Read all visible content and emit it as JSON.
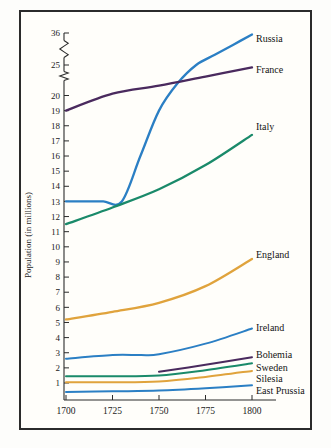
{
  "chart_data": {
    "type": "line",
    "title": "",
    "subtitle": "",
    "xlabel": "",
    "ylabel": "Population (in millions)",
    "xlim": [
      1700,
      1800
    ],
    "ylim": [
      0,
      36
    ],
    "grid": false,
    "legend_position": "right-inline-labels",
    "x_ticks": [
      "1700",
      "1725",
      "1750",
      "1775",
      "1800"
    ],
    "y_ticks": [
      "1",
      "2",
      "3",
      "4",
      "5",
      "6",
      "7",
      "8",
      "9",
      "10",
      "11",
      "12",
      "13",
      "14",
      "15",
      "16",
      "17",
      "18",
      "19",
      "20",
      "25",
      "36"
    ],
    "y_axis_breaks": [
      "between 20 and 25",
      "between 25 and 36"
    ],
    "series": [
      {
        "name": "Russia",
        "color": "#2b7fc4",
        "x": [
          1700,
          1710,
          1720,
          1730,
          1740,
          1750,
          1760,
          1770,
          1780,
          1790,
          1800
        ],
        "values": [
          13.0,
          13.0,
          13.0,
          13.0,
          16.0,
          19.0,
          22.0,
          25.0,
          28.5,
          32.0,
          35.5
        ]
      },
      {
        "name": "France",
        "color": "#4a2a5e",
        "x": [
          1700,
          1725,
          1750,
          1775,
          1800
        ],
        "values": [
          19.0,
          20.3,
          21.6,
          23.1,
          24.6
        ]
      },
      {
        "name": "Italy",
        "color": "#1a8a6a",
        "x": [
          1700,
          1725,
          1750,
          1775,
          1800
        ],
        "values": [
          11.5,
          12.6,
          13.8,
          15.4,
          17.4
        ]
      },
      {
        "name": "England",
        "color": "#e0a33c",
        "x": [
          1700,
          1725,
          1750,
          1775,
          1800
        ],
        "values": [
          5.2,
          5.7,
          6.3,
          7.4,
          9.2
        ]
      },
      {
        "name": "Ireland",
        "color": "#2b7fc4",
        "x": [
          1700,
          1725,
          1740,
          1750,
          1775,
          1800
        ],
        "values": [
          2.6,
          2.85,
          2.85,
          2.9,
          3.6,
          4.6
        ]
      },
      {
        "name": "Bohemia",
        "color": "#4a2a5e",
        "x": [
          1750,
          1775,
          1800
        ],
        "values": [
          1.75,
          2.2,
          2.7
        ]
      },
      {
        "name": "Sweden",
        "color": "#1a8a6a",
        "x": [
          1700,
          1725,
          1750,
          1775,
          1800
        ],
        "values": [
          1.45,
          1.45,
          1.5,
          1.85,
          2.3
        ]
      },
      {
        "name": "Silesia",
        "color": "#e0a33c",
        "x": [
          1700,
          1725,
          1750,
          1775,
          1800
        ],
        "values": [
          1.05,
          1.05,
          1.1,
          1.4,
          1.8
        ]
      },
      {
        "name": "East Prussia",
        "color": "#2b7fc4",
        "x": [
          1700,
          1725,
          1750,
          1775,
          1800
        ],
        "values": [
          0.4,
          0.45,
          0.5,
          0.65,
          0.85
        ]
      }
    ]
  },
  "labels": {
    "russia": "Russia",
    "france": "France",
    "italy": "Italy",
    "england": "England",
    "ireland": "Ireland",
    "bohemia": "Bohemia",
    "sweden": "Sweden",
    "silesia": "Silesia",
    "east_prussia": "East Prussia",
    "y_axis_title": "Population (in millions)"
  }
}
